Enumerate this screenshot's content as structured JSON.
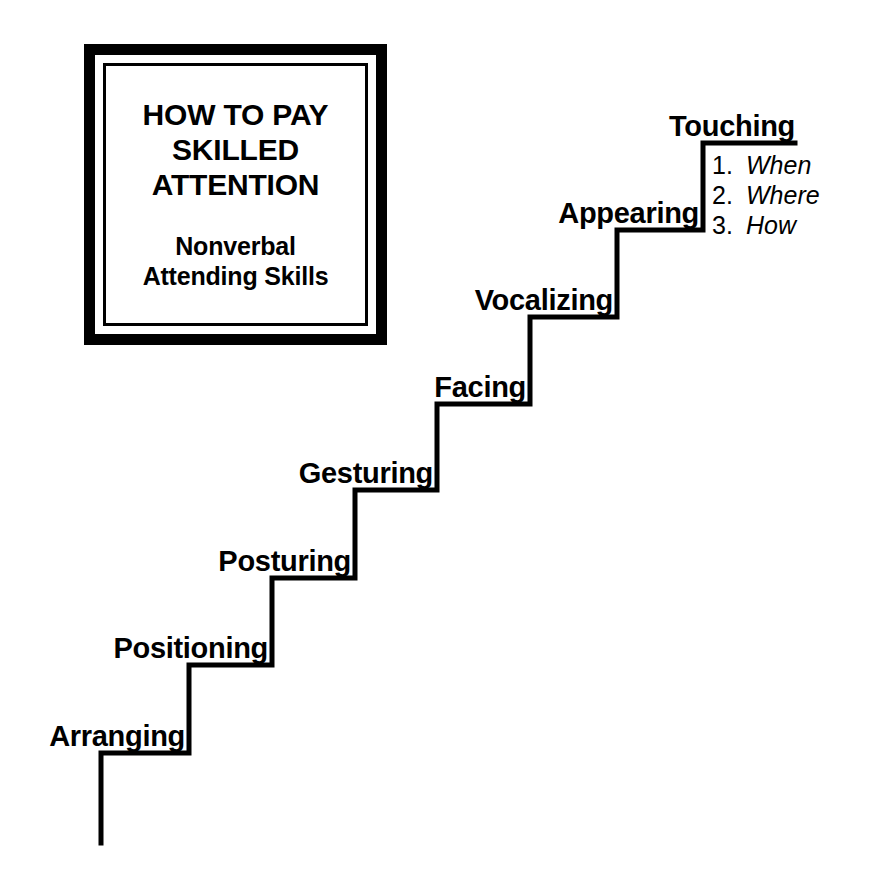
{
  "title_box": {
    "heading_lines": [
      "HOW TO PAY",
      "SKILLED",
      "ATTENTION"
    ],
    "subheading_lines": [
      "Nonverbal",
      "Attending Skills"
    ]
  },
  "staircase": {
    "orientation": "ascending-left-to-right",
    "line_color": "#000000",
    "steps": [
      {
        "label": "Arranging",
        "order": 1
      },
      {
        "label": "Positioning",
        "order": 2
      },
      {
        "label": "Posturing",
        "order": 3
      },
      {
        "label": "Gesturing",
        "order": 4
      },
      {
        "label": "Facing",
        "order": 5
      },
      {
        "label": "Vocalizing",
        "order": 6
      },
      {
        "label": "Appearing",
        "order": 7
      },
      {
        "label": "Touching",
        "order": 8
      }
    ]
  },
  "substeps": {
    "items": [
      {
        "number": "1.",
        "text": "When"
      },
      {
        "number": "2.",
        "text": "Where"
      },
      {
        "number": "3.",
        "text": "How"
      }
    ]
  }
}
